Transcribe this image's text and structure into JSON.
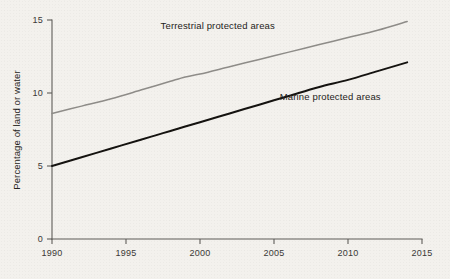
{
  "chart_data": {
    "type": "line",
    "title": "",
    "subtitle": "",
    "xlabel": "",
    "ylabel": "Percentage of land or water",
    "xlim": [
      1990,
      2015
    ],
    "ylim": [
      0,
      15
    ],
    "xticks": [
      1990,
      1995,
      2000,
      2005,
      2010,
      2015
    ],
    "xticklabels": [
      "1990",
      "1995",
      "2000",
      "2005",
      "2010",
      "2015"
    ],
    "yticks": [
      0,
      5,
      10,
      15
    ],
    "yticklabels": [
      "0",
      "5",
      "10",
      "15"
    ],
    "grid": false,
    "legend": "inline-annotations",
    "x": [
      1990,
      1992,
      1994,
      1996,
      1997,
      1998,
      1999,
      2000,
      2002,
      2004,
      2006,
      2008,
      2010,
      2012,
      2014
    ],
    "series": [
      {
        "name": "Terrestrial protected areas",
        "color": "#8e8c88",
        "values": [
          8.6,
          9.1,
          9.6,
          10.2,
          10.5,
          10.8,
          11.1,
          11.3,
          11.8,
          12.3,
          12.8,
          13.3,
          13.8,
          14.3,
          14.9
        ]
      },
      {
        "name": "Marine protected areas",
        "color": "#14120f",
        "values": [
          5.0,
          5.6,
          6.2,
          6.8,
          7.1,
          7.4,
          7.7,
          8.0,
          8.6,
          9.2,
          9.8,
          10.4,
          10.9,
          11.5,
          12.1
        ]
      }
    ],
    "annotations": [
      {
        "text": "Terrestrial protected areas",
        "x": 2001.2,
        "y": 14.35
      },
      {
        "text": "Marine protected areas",
        "x": 2008.8,
        "y": 9.55
      }
    ]
  },
  "colors": {
    "background": "#f3f1ed",
    "axis": "#5e5c58",
    "terrestrial": "#8e8c88",
    "marine": "#14120f",
    "text": "#262421"
  }
}
